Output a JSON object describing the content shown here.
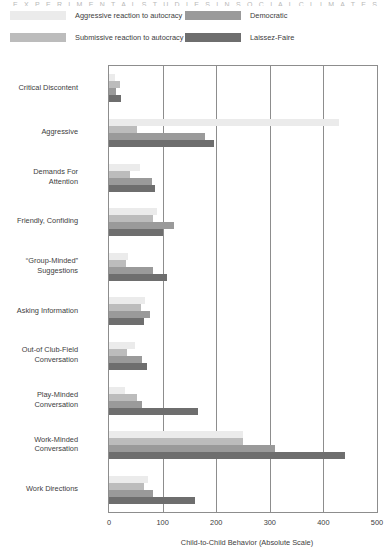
{
  "top_title": "E X P E R I M E N T A L   S T U D I E S   I N   S O C I A L   C L I M A T E S",
  "legend": {
    "items": [
      {
        "label": "Aggressive reaction to autocracy",
        "color": "#ebebeb"
      },
      {
        "label": "Submissive reaction to autocracy",
        "color": "#bcbcbc"
      },
      {
        "label": "Democratic",
        "color": "#9a9a9a"
      },
      {
        "label": "Laissez-Faire",
        "color": "#6e6e6e"
      }
    ]
  },
  "axis": {
    "x_title": "Child-to-Child Behavior (Absolute Scale)",
    "x_ticks": [
      "0",
      "100",
      "200",
      "300",
      "400",
      "500"
    ]
  },
  "chart_data": {
    "type": "bar",
    "orientation": "horizontal",
    "title": "Child-to-Child Behavior (Absolute Scale)",
    "xlabel": "Child-to-Child Behavior (Absolute Scale)",
    "ylabel": "",
    "xlim": [
      0,
      500
    ],
    "xticks": [
      0,
      100,
      200,
      300,
      400,
      500
    ],
    "grid": "vertical",
    "legend_position": "top",
    "categories": [
      "Critical Discontent",
      "Aggressive",
      "Demands For\nAttention",
      "Friendly, Confiding",
      "“Group-Minded”\nSuggestions",
      "Asking Information",
      "Out-of Club-Field\nConversation",
      "Play-Minded\nConversation",
      "Work-Minded\nConversation",
      "Work Directions"
    ],
    "series": [
      {
        "name": "Aggressive reaction to autocracy",
        "color": "#ebebeb",
        "values": [
          12,
          430,
          58,
          90,
          35,
          68,
          48,
          30,
          250,
          72
        ]
      },
      {
        "name": "Submissive reaction to autocracy",
        "color": "#bcbcbc",
        "values": [
          20,
          52,
          40,
          82,
          32,
          60,
          34,
          52,
          250,
          65
        ]
      },
      {
        "name": "Democratic",
        "color": "#9a9a9a",
        "values": [
          13,
          180,
          80,
          122,
          82,
          76,
          62,
          62,
          310,
          83
        ]
      },
      {
        "name": "Laissez-Faire",
        "color": "#6e6e6e",
        "values": [
          22,
          196,
          86,
          100,
          108,
          66,
          70,
          166,
          440,
          160
        ]
      }
    ]
  }
}
